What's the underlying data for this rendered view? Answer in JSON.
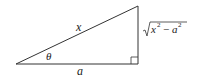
{
  "diagram": {
    "type": "right-triangle",
    "labels": {
      "hypotenuse": "x",
      "angle": "θ",
      "adjacent": "a",
      "opposite_base": "x",
      "opposite_sup1": "2",
      "opposite_minus": "−",
      "opposite_a": "a",
      "opposite_sup2": "2"
    },
    "right_angle_marker": true,
    "stroke_color": "#333333"
  }
}
